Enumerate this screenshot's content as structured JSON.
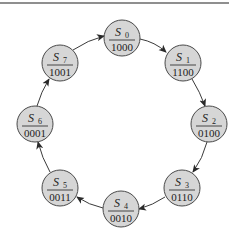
{
  "diagram": {
    "type": "state-machine-ring",
    "top_rule": {
      "x1": 0,
      "x2": 229,
      "y": 3,
      "color": "#6a6a6a"
    },
    "node_fill": "#d6d6d6",
    "node_stroke": "#4a4a4a",
    "nodes": [
      {
        "id": "S0",
        "label": "S",
        "sub": "0",
        "code": "1000",
        "cx": 122,
        "cy": 38
      },
      {
        "id": "S1",
        "label": "S",
        "sub": "1",
        "code": "1100",
        "cx": 183,
        "cy": 63
      },
      {
        "id": "S2",
        "label": "S",
        "sub": "2",
        "code": "0100",
        "cx": 209,
        "cy": 124
      },
      {
        "id": "S3",
        "label": "S",
        "sub": "3",
        "code": "0110",
        "cx": 182,
        "cy": 188
      },
      {
        "id": "S4",
        "label": "S",
        "sub": "4",
        "code": "0010",
        "cx": 121,
        "cy": 209
      },
      {
        "id": "S5",
        "label": "S",
        "sub": "5",
        "code": "0011",
        "cx": 60,
        "cy": 188
      },
      {
        "id": "S6",
        "label": "S",
        "sub": "6",
        "code": "0001",
        "cx": 35,
        "cy": 124
      },
      {
        "id": "S7",
        "label": "S",
        "sub": "7",
        "code": "1001",
        "cx": 60,
        "cy": 63
      }
    ],
    "edges": [
      {
        "from": "S0",
        "to": "S1"
      },
      {
        "from": "S1",
        "to": "S2"
      },
      {
        "from": "S2",
        "to": "S3"
      },
      {
        "from": "S3",
        "to": "S4"
      },
      {
        "from": "S4",
        "to": "S5"
      },
      {
        "from": "S5",
        "to": "S6"
      },
      {
        "from": "S6",
        "to": "S7"
      },
      {
        "from": "S7",
        "to": "S0"
      }
    ]
  }
}
